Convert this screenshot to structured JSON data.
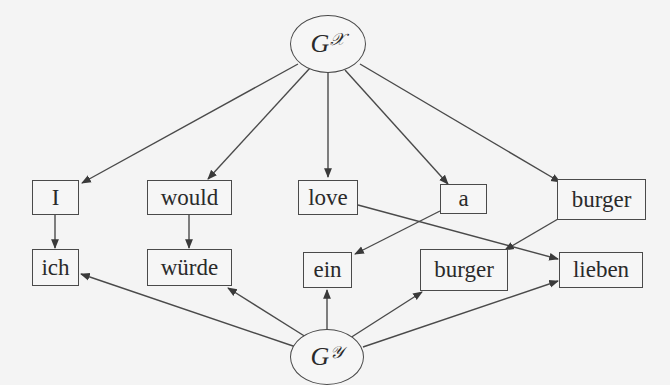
{
  "graph_x": {
    "base": "G",
    "superscript": "𝒳"
  },
  "graph_y": {
    "base": "G",
    "superscript": "𝒴"
  },
  "source_tokens": [
    "I",
    "would",
    "love",
    "a",
    "burger"
  ],
  "target_tokens": [
    "ich",
    "würde",
    "ein",
    "burger",
    "lieben"
  ],
  "alignments": [
    {
      "from": "I",
      "to": "ich"
    },
    {
      "from": "would",
      "to": "würde"
    },
    {
      "from": "love",
      "to": "lieben"
    },
    {
      "from": "a",
      "to": "ein"
    },
    {
      "from": "burger",
      "to": "burger"
    }
  ],
  "colors": {
    "stroke": "#4a4a4a",
    "background": "#f4f4f4",
    "text": "#2a2a2a"
  }
}
